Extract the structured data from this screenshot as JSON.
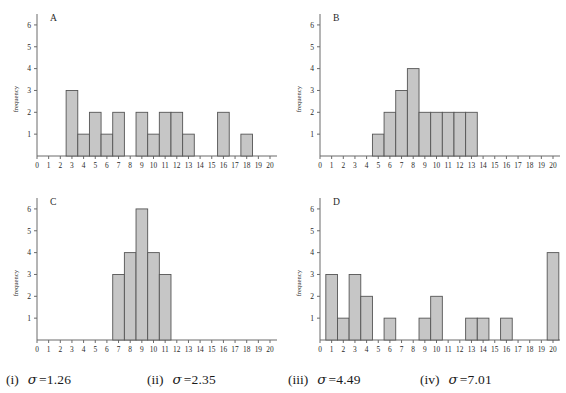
{
  "figure": {
    "title": "",
    "panel_count": 4,
    "bar_fill": "#c6c6c6",
    "bar_stroke": "#555555",
    "axis_color": "#6b6b6b"
  },
  "axis": {
    "y_label": "frequency",
    "y_ticks": [
      1,
      2,
      3,
      4,
      5,
      6
    ],
    "y_min": 0,
    "y_max": 6.5,
    "x_ticks": [
      0,
      1,
      2,
      3,
      4,
      5,
      6,
      7,
      8,
      9,
      10,
      11,
      12,
      13,
      14,
      15,
      16,
      17,
      18,
      19,
      20
    ],
    "x_min": 0,
    "x_max": 20.6,
    "x_label": ""
  },
  "panels": [
    {
      "letter": "A",
      "name": "panel-a"
    },
    {
      "letter": "B",
      "name": "panel-b"
    },
    {
      "letter": "C",
      "name": "panel-c"
    },
    {
      "letter": "D",
      "name": "panel-d"
    }
  ],
  "caption": {
    "items": [
      {
        "roman": "(i)",
        "symbol": "σ",
        "eq": "=1.26"
      },
      {
        "roman": "(ii)",
        "symbol": "σ",
        "eq": "=2.35"
      },
      {
        "roman": "(iii)",
        "symbol": "σ",
        "eq": "=4.49"
      },
      {
        "roman": "(iv)",
        "symbol": "σ",
        "eq": "=7.01"
      }
    ]
  },
  "chart_data": [
    {
      "type": "bar",
      "title": "A",
      "xlabel": "",
      "ylabel": "frequency",
      "xlim": [
        0,
        20.6
      ],
      "ylim": [
        0,
        6.5
      ],
      "grid": false,
      "legend": "none",
      "bin_width": 1,
      "categories": [
        0,
        1,
        2,
        3,
        4,
        5,
        6,
        7,
        8,
        9,
        10,
        11,
        12,
        13,
        14,
        15,
        16,
        17,
        18,
        19,
        20
      ],
      "values": [
        0,
        0,
        0,
        3,
        1,
        2,
        1,
        2,
        0,
        2,
        1,
        2,
        2,
        1,
        0,
        0,
        2,
        0,
        1,
        0,
        0
      ],
      "annotation": "sigma = 1.26 is NOT this panel; see caption mapping"
    },
    {
      "type": "bar",
      "title": "B",
      "xlabel": "",
      "ylabel": "frequency",
      "xlim": [
        0,
        20.6
      ],
      "ylim": [
        0,
        6.5
      ],
      "grid": false,
      "legend": "none",
      "bin_width": 1,
      "categories": [
        0,
        1,
        2,
        3,
        4,
        5,
        6,
        7,
        8,
        9,
        10,
        11,
        12,
        13,
        14,
        15,
        16,
        17,
        18,
        19,
        20
      ],
      "values": [
        0,
        0,
        0,
        0,
        0,
        1,
        2,
        3,
        4,
        2,
        2,
        2,
        2,
        2,
        0,
        0,
        0,
        0,
        0,
        0,
        0
      ]
    },
    {
      "type": "bar",
      "title": "C",
      "xlabel": "",
      "ylabel": "frequency",
      "xlim": [
        0,
        20.6
      ],
      "ylim": [
        0,
        6.5
      ],
      "grid": false,
      "legend": "none",
      "bin_width": 1,
      "categories": [
        0,
        1,
        2,
        3,
        4,
        5,
        6,
        7,
        8,
        9,
        10,
        11,
        12,
        13,
        14,
        15,
        16,
        17,
        18,
        19,
        20
      ],
      "values": [
        0,
        0,
        0,
        0,
        0,
        0,
        0,
        3,
        4,
        6,
        4,
        3,
        0,
        0,
        0,
        0,
        0,
        0,
        0,
        0,
        0
      ]
    },
    {
      "type": "bar",
      "title": "D",
      "xlabel": "",
      "ylabel": "frequency",
      "xlim": [
        0,
        20.6
      ],
      "ylim": [
        0,
        6.5
      ],
      "grid": false,
      "legend": "none",
      "bin_width": 1,
      "categories": [
        0,
        1,
        2,
        3,
        4,
        5,
        6,
        7,
        8,
        9,
        10,
        11,
        12,
        13,
        14,
        15,
        16,
        17,
        18,
        19,
        20
      ],
      "values": [
        0,
        3,
        1,
        3,
        2,
        0,
        1,
        0,
        0,
        1,
        2,
        0,
        0,
        1,
        1,
        0,
        1,
        0,
        0,
        0,
        4
      ]
    }
  ]
}
